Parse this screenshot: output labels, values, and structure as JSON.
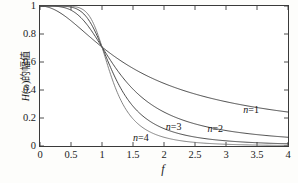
{
  "chart_data": {
    "type": "line",
    "title": "",
    "subtitle": "",
    "xlabel": "f",
    "ylabel": "H(ω)的幅值",
    "xlim": [
      0,
      4
    ],
    "ylim": [
      0,
      1
    ],
    "grid": false,
    "legend_position": "inline-annotations",
    "x_ticks": [
      "0",
      "0.5",
      "1",
      "1.5",
      "2",
      "2.5",
      "3",
      "3.5",
      "4"
    ],
    "x_tick_values": [
      0,
      0.5,
      1,
      1.5,
      2,
      2.5,
      3,
      3.5,
      4
    ],
    "y_ticks": [
      "0",
      "0.2",
      "0.4",
      "0.6",
      "0.8",
      "1"
    ],
    "y_tick_values": [
      0,
      0.2,
      0.4,
      0.6,
      0.8,
      1
    ],
    "series": [
      {
        "name": "n=1",
        "order": 1,
        "color": "#2b2b2b",
        "x": [
          0,
          0.2,
          0.4,
          0.6,
          0.8,
          1.0,
          1.2,
          1.4,
          1.6,
          1.8,
          2.0,
          2.2,
          2.4,
          2.6,
          2.8,
          3.0,
          3.2,
          3.4,
          3.6,
          3.8,
          4.0
        ],
        "values": [
          1.0,
          0.981,
          0.928,
          0.857,
          0.781,
          0.707,
          0.64,
          0.581,
          0.53,
          0.486,
          0.447,
          0.414,
          0.384,
          0.359,
          0.336,
          0.316,
          0.298,
          0.283,
          0.268,
          0.255,
          0.243
        ]
      },
      {
        "name": "n=2",
        "order": 2,
        "color": "#2b2b2b",
        "x": [
          0,
          0.2,
          0.4,
          0.6,
          0.8,
          1.0,
          1.2,
          1.4,
          1.6,
          1.8,
          2.0,
          2.2,
          2.4,
          2.6,
          2.8,
          3.0,
          3.2,
          3.4,
          3.6,
          3.8,
          4.0
        ],
        "values": [
          1.0,
          0.999,
          0.987,
          0.939,
          0.839,
          0.707,
          0.566,
          0.442,
          0.347,
          0.276,
          0.243,
          0.204,
          0.172,
          0.147,
          0.127,
          0.111,
          0.097,
          0.086,
          0.077,
          0.069,
          0.062
        ]
      },
      {
        "name": "n=3",
        "order": 3,
        "color": "#2b2b2b",
        "x": [
          0,
          0.2,
          0.4,
          0.6,
          0.8,
          1.0,
          1.2,
          1.4,
          1.6,
          1.8,
          2.0,
          2.2,
          2.4,
          2.6,
          2.8,
          3.0,
          3.2,
          3.4,
          3.6,
          3.8,
          4.0
        ],
        "values": [
          1.0,
          1.0,
          0.998,
          0.978,
          0.891,
          0.707,
          0.499,
          0.323,
          0.21,
          0.14,
          0.097,
          0.069,
          0.05,
          0.038,
          0.029,
          0.023,
          0.018,
          0.015,
          0.012,
          0.01,
          0.008
        ]
      },
      {
        "name": "n=4",
        "order": 4,
        "color": "#6e6e6e",
        "x": [
          0,
          0.2,
          0.4,
          0.6,
          0.8,
          1.0,
          1.2,
          1.4,
          1.6,
          1.8,
          2.0,
          2.2,
          2.4,
          2.6,
          2.8,
          3.0,
          3.2,
          3.4,
          3.6,
          3.8,
          4.0
        ],
        "values": [
          1.0,
          1.0,
          1.0,
          0.993,
          0.928,
          0.707,
          0.431,
          0.231,
          0.124,
          0.07,
          0.042,
          0.026,
          0.017,
          0.012,
          0.008,
          0.006,
          0.004,
          0.003,
          0.002,
          0.002,
          0.001
        ]
      }
    ],
    "annotations": [
      {
        "text": "n=1",
        "x": 3.28,
        "y": 0.26
      },
      {
        "text": "n=2",
        "x": 2.7,
        "y": 0.125
      },
      {
        "text": "n=3",
        "x": 2.03,
        "y": 0.135
      },
      {
        "text": "n=4",
        "x": 1.5,
        "y": 0.055
      }
    ]
  },
  "axes": {
    "x_title": "f",
    "y_title_prefix": "H",
    "y_title_omega": "(ω)",
    "y_title_suffix": "的幅值"
  }
}
